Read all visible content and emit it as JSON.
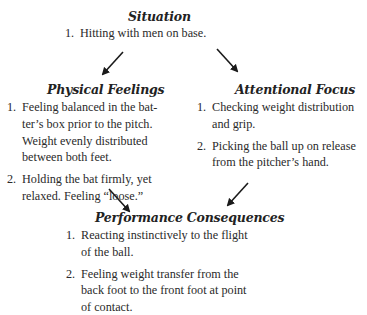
{
  "diagram": {
    "nodes": {
      "situation": {
        "title": "Situation",
        "items": [
          {
            "num": "1.",
            "text": "Hitting with men on base."
          }
        ]
      },
      "physical": {
        "title": "Physical Feelings",
        "items": [
          {
            "num": "1.",
            "text": "Feeling balanced in the bat-ter’s box prior to the pitch. Weight evenly distributed between both feet."
          },
          {
            "num": "2.",
            "text": "Holding the bat firmly, yet relaxed. Feeling “loose.”"
          }
        ]
      },
      "attentional": {
        "title": "Attentional Focus",
        "items": [
          {
            "num": "1.",
            "text": "Checking weight distribution and grip."
          },
          {
            "num": "2.",
            "text": "Picking the ball up on release from the pitcher’s hand."
          }
        ]
      },
      "performance": {
        "title": "Performance Consequences",
        "items": [
          {
            "num": "1.",
            "text": "Reacting instinctively to the flight of the ball."
          },
          {
            "num": "2.",
            "text": "Feeling weight transfer from the back foot to the front foot at point of contact."
          }
        ]
      }
    },
    "edges": [
      {
        "from": "situation",
        "to": "physical"
      },
      {
        "from": "situation",
        "to": "attentional"
      },
      {
        "from": "physical",
        "to": "performance"
      },
      {
        "from": "attentional",
        "to": "performance"
      }
    ]
  }
}
